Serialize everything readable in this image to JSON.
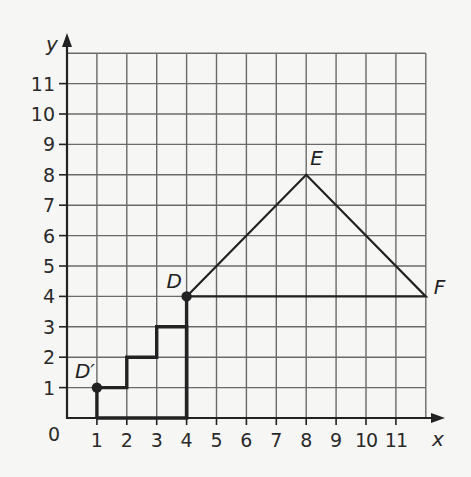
{
  "diagram": {
    "type": "coordinate-grid",
    "axes": {
      "x_label": "x",
      "y_label": "y",
      "origin_label": "0",
      "x_ticks": [
        "1",
        "2",
        "3",
        "4",
        "5",
        "6",
        "7",
        "8",
        "9",
        "10",
        "11"
      ],
      "y_ticks": [
        "1",
        "2",
        "3",
        "4",
        "5",
        "6",
        "7",
        "8",
        "9",
        "10",
        "11"
      ],
      "x_range": [
        0,
        12
      ],
      "y_range": [
        0,
        12
      ]
    },
    "points": [
      {
        "label": "D",
        "x": 4,
        "y": 4,
        "dot": true
      },
      {
        "label": "E",
        "x": 8,
        "y": 8,
        "dot": false
      },
      {
        "label": "F",
        "x": 12,
        "y": 4,
        "dot": false
      },
      {
        "label": "D′",
        "x": 1,
        "y": 1,
        "dot": true
      }
    ],
    "triangle": [
      [
        4,
        4
      ],
      [
        8,
        8
      ],
      [
        12,
        4
      ]
    ],
    "staircase_path": [
      [
        1,
        0
      ],
      [
        1,
        1
      ],
      [
        2,
        1
      ],
      [
        2,
        2
      ],
      [
        3,
        2
      ],
      [
        3,
        3
      ],
      [
        4,
        3
      ],
      [
        4,
        0
      ],
      [
        1,
        0
      ]
    ],
    "vertical_segment": [
      [
        4,
        4
      ],
      [
        4,
        0
      ]
    ],
    "colors": {
      "grid": "#6a6a6a",
      "axis": "#222222",
      "shape": "#222222",
      "background": "#f6f6f4"
    }
  }
}
